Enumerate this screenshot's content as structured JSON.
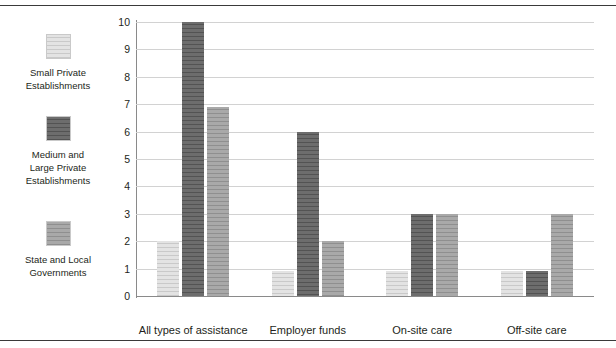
{
  "chart_data": {
    "type": "bar",
    "title": "",
    "subtitle": "",
    "xlabel": "",
    "ylabel": "",
    "ylim": [
      0,
      10
    ],
    "yticks": [
      "0",
      "1",
      "2",
      "3",
      "4",
      "5",
      "6",
      "7",
      "8",
      "9",
      "10"
    ],
    "grid": true,
    "legend_position": "left",
    "categories": [
      "All types of assistance",
      "Employer funds",
      "On-site care",
      "Off-site care"
    ],
    "series": [
      {
        "name": "Small Private Establishments",
        "color": "#e3e3e3",
        "values": [
          2,
          0.9,
          0.9,
          0.9
        ]
      },
      {
        "name": "Medium and Large Private Establishments",
        "color": "#6d6d6d",
        "values": [
          10,
          6,
          3,
          0.9
        ]
      },
      {
        "name": "State and Local Governments",
        "color": "#a9a9a9",
        "values": [
          6.9,
          2,
          3,
          3
        ]
      }
    ]
  },
  "legend": {
    "items": [
      {
        "label_line1": "Small Private",
        "label_line2": "Establishments",
        "label_line3": "",
        "swatch_name": "legend-swatch-small-private"
      },
      {
        "label_line1": "Medium and",
        "label_line2": "Large Private",
        "label_line3": "Establishments",
        "swatch_name": "legend-swatch-medium-large-private"
      },
      {
        "label_line1": "State and Local",
        "label_line2": "Governments",
        "label_line3": "",
        "swatch_name": "legend-swatch-state-local"
      }
    ]
  },
  "colors": {
    "series_light": "#e3e3e3",
    "series_dark": "#6d6d6d",
    "series_medium": "#a9a9a9",
    "gridline": "#d2d2d2",
    "axis": "#8a8a8a",
    "rule": "#3a3a3a",
    "text": "#231f20",
    "background": "#ffffff"
  }
}
